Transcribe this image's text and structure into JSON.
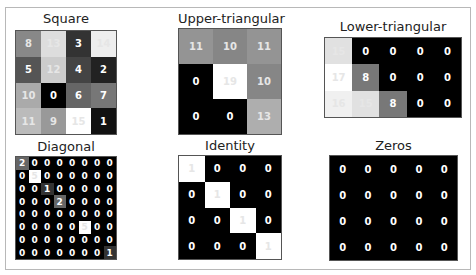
{
  "chart_data": [
    {
      "type": "heatmap",
      "title": "Square",
      "colormap": "gray",
      "vmin": 0,
      "vmax": 15,
      "values": [
        [
          8,
          13,
          3,
          14
        ],
        [
          5,
          12,
          4,
          2
        ],
        [
          10,
          0,
          6,
          7
        ],
        [
          11,
          9,
          15,
          1
        ]
      ]
    },
    {
      "type": "heatmap",
      "title": "Upper-triangular",
      "colormap": "gray",
      "vmin": 0,
      "vmax": 19,
      "values": [
        [
          11,
          10,
          11
        ],
        [
          0,
          19,
          10
        ],
        [
          0,
          0,
          13
        ]
      ]
    },
    {
      "type": "heatmap",
      "title": "Lower-triangular",
      "colormap": "gray",
      "vmin": 0,
      "vmax": 17,
      "values": [
        [
          15,
          0,
          0,
          0,
          0
        ],
        [
          17,
          8,
          0,
          0,
          0
        ],
        [
          16,
          15,
          8,
          0,
          0
        ]
      ]
    },
    {
      "type": "heatmap",
      "title": "Diagonal",
      "colormap": "gray",
      "vmin": 0,
      "vmax": 5,
      "values": [
        [
          2,
          0,
          0,
          0,
          0,
          0,
          0,
          0
        ],
        [
          0,
          5,
          0,
          0,
          0,
          0,
          0,
          0
        ],
        [
          0,
          0,
          1,
          0,
          0,
          0,
          0,
          0
        ],
        [
          0,
          0,
          0,
          2,
          0,
          0,
          0,
          0
        ],
        [
          0,
          0,
          0,
          0,
          0,
          0,
          0,
          0
        ],
        [
          0,
          0,
          0,
          0,
          0,
          5,
          0,
          0
        ],
        [
          0,
          0,
          0,
          0,
          0,
          0,
          0,
          0
        ],
        [
          0,
          0,
          0,
          0,
          0,
          0,
          0,
          1
        ]
      ]
    },
    {
      "type": "heatmap",
      "title": "Identity",
      "colormap": "gray",
      "vmin": 0,
      "vmax": 1,
      "values": [
        [
          1,
          0,
          0,
          0
        ],
        [
          0,
          1,
          0,
          0
        ],
        [
          0,
          0,
          1,
          0
        ],
        [
          0,
          0,
          0,
          1
        ]
      ]
    },
    {
      "type": "heatmap",
      "title": "Zeros",
      "colormap": "gray",
      "vmin": 0,
      "vmax": 1,
      "values": [
        [
          0,
          0,
          0,
          0,
          0
        ],
        [
          0,
          0,
          0,
          0,
          0
        ],
        [
          0,
          0,
          0,
          0,
          0
        ],
        [
          0,
          0,
          0,
          0,
          0
        ]
      ]
    }
  ]
}
